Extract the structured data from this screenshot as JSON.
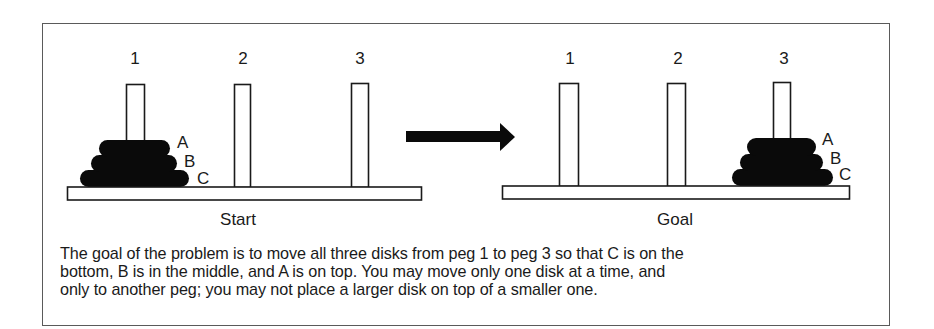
{
  "figure": {
    "panels": [
      {
        "id": "start",
        "label": "Start",
        "peg_labels": [
          "1",
          "2",
          "3"
        ],
        "disks_on_peg": 1,
        "disk_labels": [
          "A",
          "B",
          "C"
        ]
      },
      {
        "id": "goal",
        "label": "Goal",
        "peg_labels": [
          "1",
          "2",
          "3"
        ],
        "disks_on_peg": 3,
        "disk_labels": [
          "A",
          "B",
          "C"
        ]
      }
    ],
    "arrow": "right-arrow",
    "caption_lines": [
      "The goal of the problem is to move all three disks from peg 1 to peg 3 so that C is on the",
      "bottom, B is in the middle, and A is on top. You may move only one disk at a time, and",
      "only to another peg; you may not place a larger disk on top of a smaller one."
    ],
    "colors": {
      "disk": "#0a0a0a",
      "outline": "#1a1a1a",
      "frame": "#5a5a5a",
      "background": "#ffffff"
    }
  }
}
